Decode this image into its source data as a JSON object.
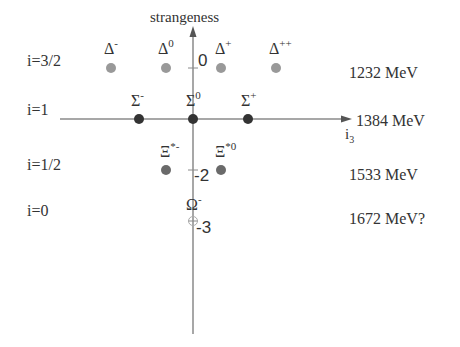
{
  "axes": {
    "y_label": "strangeness",
    "x_label": "i",
    "x_label_sub": "3",
    "ticks": [
      "0",
      "-2",
      "-3"
    ],
    "axis_color": "#8a8a8a"
  },
  "rows": [
    {
      "isospin": "i=3/2",
      "mass": "1232 MeV"
    },
    {
      "isospin": "i=1",
      "mass": "1384 MeV"
    },
    {
      "isospin": "i=1/2",
      "mass": "1533 MeV"
    },
    {
      "isospin": "i=0",
      "mass": "1672 MeV?"
    }
  ],
  "particles": {
    "delta": [
      {
        "base": "Δ",
        "sup": "-"
      },
      {
        "base": "Δ",
        "sup": "0"
      },
      {
        "base": "Δ",
        "sup": "+"
      },
      {
        "base": "Δ",
        "sup": "++"
      }
    ],
    "sigma": [
      {
        "base": "Σ",
        "sup": "-"
      },
      {
        "base": "Σ",
        "sup": "0"
      },
      {
        "base": "Σ",
        "sup": "+"
      }
    ],
    "xi": [
      {
        "base": "Ξ",
        "sup": "*-"
      },
      {
        "base": "Ξ",
        "sup": "*0"
      }
    ],
    "omega": {
      "base": "Ω",
      "sup": "-"
    }
  },
  "colors": {
    "light_dot": "#999999",
    "dark_dot": "#333333",
    "xi_dot": "#6a6a6a",
    "omega_outline": "#aaaaaa"
  }
}
